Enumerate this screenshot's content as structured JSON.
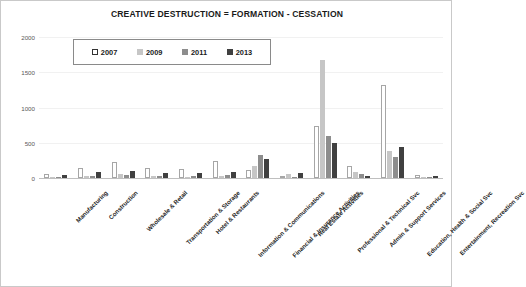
{
  "chart_data": {
    "type": "bar",
    "title": "CREATIVE DESTRUCTION = FORMATION - CESSATION",
    "xlabel": "",
    "ylabel": "",
    "ylim": [
      -150,
      2000
    ],
    "yticks": [
      0,
      500,
      1000,
      1500,
      2000
    ],
    "ytick_labels": [
      "0",
      "500",
      "1000",
      "1500",
      "2000"
    ],
    "grid": false,
    "legend_position": "top-left-inside",
    "categories": [
      "Manufacturing",
      "Construction",
      "Wholesale & Retail",
      "Transportation  & Storage",
      "Hotel & Restaurants",
      "Information & Communications",
      "Financial & Insurance Activities",
      "Real Estate Activities",
      "Professional & Technical Svc",
      "Admin & Support Services",
      "Education, Health & Social Svc",
      "Entertainment, Recreation Svc"
    ],
    "series": [
      {
        "name": "2007",
        "color": "#ffffff",
        "values": [
          60,
          150,
          230,
          145,
          135,
          245,
          120,
          30,
          735,
          180,
          1320,
          45
        ]
      },
      {
        "name": "2009",
        "color": "#c6c6c6",
        "values": [
          20,
          30,
          60,
          30,
          25,
          40,
          180,
          60,
          1680,
          90,
          390,
          20
        ]
      },
      {
        "name": "2011",
        "color": "#8d8d8d",
        "values": [
          25,
          40,
          55,
          35,
          30,
          55,
          330,
          20,
          600,
          60,
          300,
          25
        ]
      },
      {
        "name": "2013",
        "color": "#404040",
        "values": [
          55,
          95,
          105,
          70,
          80,
          90,
          270,
          75,
          500,
          40,
          450,
          30
        ]
      }
    ]
  },
  "legend": {
    "items": [
      {
        "label": "2007",
        "swatch": "#ffffff"
      },
      {
        "label": "2009",
        "swatch": "#c6c6c6"
      },
      {
        "label": "2011",
        "swatch": "#8d8d8d"
      },
      {
        "label": "2013",
        "swatch": "#404040"
      }
    ]
  }
}
